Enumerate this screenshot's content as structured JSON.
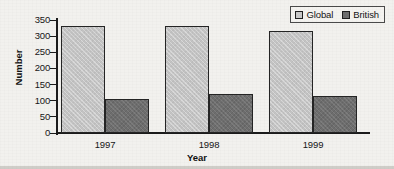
{
  "chart_data": {
    "type": "bar",
    "title": "",
    "subtitle": "",
    "xlabel": "Year",
    "ylabel": "Number",
    "categories": [
      "1997",
      "1998",
      "1999"
    ],
    "series": [
      {
        "name": "Global",
        "color": "#c4c4c4",
        "values": [
          333,
          332,
          316
        ]
      },
      {
        "name": "British",
        "color": "#6e6e6e",
        "values": [
          105,
          121,
          115
        ]
      }
    ],
    "ylim": [
      0,
      350
    ],
    "ytick_step": 50,
    "yticks": [
      0,
      50,
      100,
      150,
      200,
      250,
      300,
      350
    ],
    "ytick_labels": [
      "0",
      "50",
      "100",
      "150",
      "200",
      "250",
      "300",
      "350"
    ],
    "grid": false,
    "legend_position": "top-right",
    "annotations": []
  },
  "legend": {
    "items": [
      {
        "label": "Global",
        "swatch": "legend-swatch-light"
      },
      {
        "label": "British",
        "swatch": "legend-swatch-dark"
      }
    ]
  },
  "colors": {
    "global_bar": "#c4c4c4",
    "british_bar": "#6e6e6e",
    "axis": "#1b1b1b",
    "background": "#f2f1ee"
  }
}
